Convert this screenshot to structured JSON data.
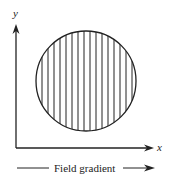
{
  "diagram": {
    "axes": {
      "x_label": "x",
      "y_label": "y"
    },
    "caption": "Field gradient",
    "shape": {
      "type": "circle",
      "fill_pattern": "vertical-stripes",
      "stripe_count": 16
    },
    "colors": {
      "stroke": "#222222",
      "background": "#ffffff"
    }
  }
}
